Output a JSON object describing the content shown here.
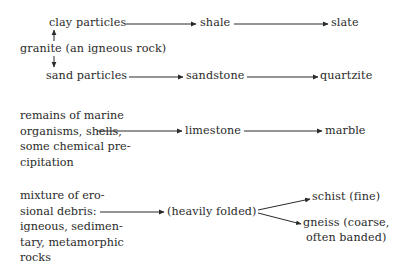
{
  "diagram": {
    "type": "rock-formation-flow",
    "row1": {
      "clay": "clay particles",
      "shale": "shale",
      "slate": "slate",
      "granite": "granite (an igneous rock)",
      "sand": "sand particles",
      "sandstone": "sandstone",
      "quartzite": "quartzite"
    },
    "row2": {
      "source_lines": [
        "remains of marine",
        "organisms, shells,",
        "some chemical pre-",
        "cipitation"
      ],
      "limestone": "limestone",
      "marble": "marble"
    },
    "row3": {
      "source_lines": [
        "mixture of ero-",
        "sional debris:",
        "igneous, sedimen-",
        "tary, metamorphic",
        "rocks"
      ],
      "process": "(heavily folded)",
      "schist": "schist (fine)",
      "gneiss_lines": [
        "gneiss (coarse,",
        "often banded)"
      ]
    },
    "colors": {
      "text": "#2a2a2a",
      "arrow": "#2a2a2a",
      "background": "#ffffff"
    }
  }
}
